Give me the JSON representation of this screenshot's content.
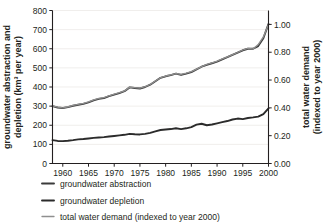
{
  "chart_data": {
    "type": "line",
    "title": "",
    "xlabel": "",
    "ylabel": "groundwater abstraction and depletion (km³ per year)",
    "y2label": "total water demand (indexed to year 2000)",
    "grid": true,
    "legend_position": "bottom-left",
    "xlim": [
      1958,
      2000
    ],
    "ylim": [
      0,
      800
    ],
    "y2lim": [
      0.0,
      1.1
    ],
    "xticks": [
      1960,
      1965,
      1970,
      1975,
      1980,
      1985,
      1990,
      1995,
      2000
    ],
    "xtick_labels": [
      "1960",
      "1965",
      "1970",
      "1975",
      "1980",
      "1985",
      "1990",
      "1995",
      "2000"
    ],
    "yticks": [
      0,
      100,
      200,
      300,
      400,
      500,
      600,
      700,
      800
    ],
    "ytick_labels": [
      "0",
      "100",
      "200",
      "300",
      "400",
      "500",
      "600",
      "700",
      "800"
    ],
    "y2ticks": [
      0.0,
      0.2,
      0.4,
      0.6,
      0.8,
      1.0
    ],
    "y2tick_labels": [
      "0.00",
      "0.20",
      "0.40",
      "0.60",
      "0.80",
      "1.00"
    ],
    "x": [
      1958,
      1959,
      1960,
      1961,
      1962,
      1963,
      1964,
      1965,
      1966,
      1967,
      1968,
      1969,
      1970,
      1971,
      1972,
      1973,
      1974,
      1975,
      1976,
      1977,
      1978,
      1979,
      1980,
      1981,
      1982,
      1983,
      1984,
      1985,
      1986,
      1987,
      1988,
      1989,
      1990,
      1991,
      1992,
      1993,
      1994,
      1995,
      1996,
      1997,
      1998,
      1999,
      2000
    ],
    "series": [
      {
        "name": "groundwater abstraction",
        "axis": "left",
        "color": "#3b3b3b",
        "width": 1.9,
        "values": [
          300,
          293,
          290,
          295,
          302,
          307,
          312,
          320,
          330,
          338,
          342,
          352,
          360,
          368,
          378,
          398,
          395,
          392,
          400,
          412,
          430,
          448,
          456,
          462,
          470,
          463,
          470,
          478,
          492,
          506,
          516,
          524,
          533,
          545,
          556,
          568,
          580,
          592,
          600,
          600,
          614,
          655,
          730
        ]
      },
      {
        "name": "groundwater depletion",
        "axis": "left",
        "color": "#2b2b2b",
        "width": 1.9,
        "values": [
          122,
          118,
          117,
          119,
          122,
          126,
          128,
          131,
          134,
          136,
          138,
          141,
          144,
          147,
          150,
          155,
          153,
          152,
          155,
          160,
          168,
          175,
          178,
          180,
          184,
          180,
          184,
          190,
          203,
          208,
          200,
          204,
          210,
          216,
          222,
          230,
          235,
          232,
          238,
          241,
          245,
          258,
          288
        ]
      },
      {
        "name": "total water demand (indexed to year 2000)",
        "axis": "right",
        "color": "#8f8f8f",
        "width": 1.3,
        "values": [
          0.415,
          0.405,
          0.4,
          0.408,
          0.418,
          0.425,
          0.432,
          0.443,
          0.457,
          0.468,
          0.473,
          0.487,
          0.498,
          0.509,
          0.522,
          0.549,
          0.546,
          0.542,
          0.552,
          0.568,
          0.593,
          0.617,
          0.629,
          0.637,
          0.647,
          0.64,
          0.649,
          0.66,
          0.678,
          0.697,
          0.712,
          0.723,
          0.736,
          0.752,
          0.767,
          0.783,
          0.798,
          0.816,
          0.828,
          0.824,
          0.855,
          0.91,
          1.0
        ]
      }
    ]
  },
  "legend": {
    "items": [
      {
        "label": "groundwater abstraction",
        "color": "#3b3b3b",
        "width": 1.9
      },
      {
        "label": "groundwater depletion",
        "color": "#2b2b2b",
        "width": 1.9
      },
      {
        "label": "total water demand (indexed to year 2000)",
        "color": "#8f8f8f",
        "width": 1.3
      }
    ]
  }
}
